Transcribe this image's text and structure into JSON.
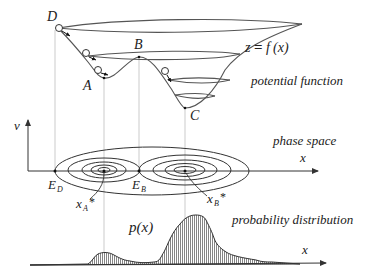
{
  "diagram": {
    "colors": {
      "line": "#333333",
      "guide": "#9a9a9a",
      "fill": "#9a9a9a",
      "background": "#ffffff"
    },
    "potential": {
      "equation": "z = f(x)",
      "equation_parts": {
        "z": "z",
        "eq": "=",
        "f": "f",
        "x": "(x)"
      },
      "caption": "potential function",
      "points": {
        "D": "D",
        "A": "A",
        "B": "B",
        "C": "C"
      }
    },
    "phase_space": {
      "caption": "phase space",
      "axis_x": "x",
      "axis_v": "v",
      "points": {
        "ED": "E",
        "ED_sub": "D",
        "EB": "E",
        "EB_sub": "B"
      },
      "attractors": {
        "xA": "x",
        "xA_sub": "A",
        "xA_star": "*",
        "xB": "x",
        "xB_sub": "B",
        "xB_star": "*"
      }
    },
    "distribution": {
      "caption": "probability distribution",
      "label": "p(x)",
      "axis_x": "x"
    }
  }
}
